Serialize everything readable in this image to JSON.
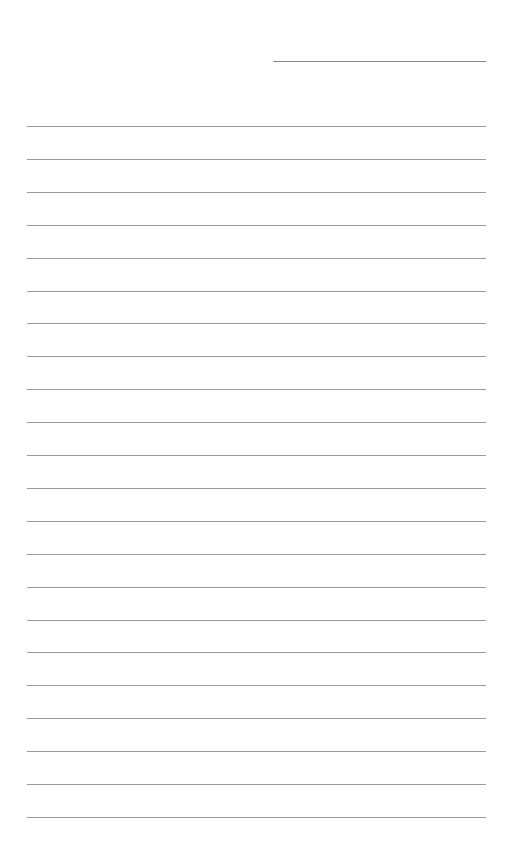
{
  "page": {
    "type": "lined-paper",
    "background": "#ffffff",
    "line_color": "#9a9a9a",
    "header_line": {
      "x": 273,
      "y": 61,
      "width": 213
    },
    "rules": {
      "count": 22,
      "start_y": 126,
      "spacing": 32.9,
      "x": 27,
      "width": 459
    }
  }
}
